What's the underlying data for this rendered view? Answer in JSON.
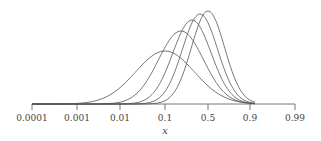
{
  "chart_data": {
    "type": "line",
    "title": "",
    "xlabel": "x",
    "ylabel": "",
    "x_scale": "logit",
    "grid": false,
    "legend": null,
    "x_ticks": [
      {
        "label": "0.0001",
        "px": 32
      },
      {
        "label": "0.001",
        "px": 77
      },
      {
        "label": "0.01",
        "px": 120
      },
      {
        "label": "0.1",
        "px": 165
      },
      {
        "label": "0.5",
        "px": 208
      },
      {
        "label": "0.9",
        "px": 250
      },
      {
        "label": "0.99",
        "px": 295
      }
    ],
    "series": [
      {
        "name": "curve-1",
        "peak_x": 0.1,
        "peak_px": 165,
        "peak_py": 51,
        "spread": 1.5
      },
      {
        "name": "curve-2",
        "peak_x": 0.2,
        "peak_px": 181,
        "peak_py": 31,
        "spread": 1.15
      },
      {
        "name": "curve-3",
        "peak_x": 0.3,
        "peak_px": 192,
        "peak_py": 20,
        "spread": 0.98
      },
      {
        "name": "curve-4",
        "peak_x": 0.4,
        "peak_px": 200,
        "peak_py": 14,
        "spread": 0.9
      },
      {
        "name": "curve-5",
        "peak_x": 0.5,
        "peak_px": 208,
        "peak_py": 11,
        "spread": 0.85
      }
    ],
    "axis": {
      "y_px": 104,
      "x_start_px": 32,
      "x_end_px": 295
    },
    "line_color": "#555555"
  }
}
